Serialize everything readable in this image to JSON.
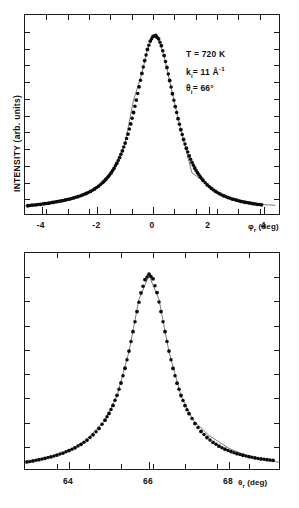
{
  "figure": {
    "ylabel": "INTENSITY (arb. units)",
    "panels": [
      {
        "id": "top",
        "xlabel_symbol": "φ",
        "xlabel_sub": "r",
        "xlabel_unit": "(deg)",
        "tick_labels": [
          "-4",
          "-2",
          "0",
          "2",
          "4"
        ],
        "annotations": {
          "temperature": "T = 720 K",
          "wavevector_symbol": "k",
          "wavevector_sub": "i",
          "wavevector_value": "= 11 Å",
          "wavevector_sup": "-1",
          "angle_symbol": "θ",
          "angle_sub": "i",
          "angle_value": "= 66°"
        }
      },
      {
        "id": "bottom",
        "xlabel_symbol": "θ",
        "xlabel_sub": "r",
        "xlabel_unit": "(deg)",
        "tick_labels": [
          "64",
          "66",
          "68"
        ]
      }
    ]
  },
  "chart_data": [
    {
      "type": "scatter",
      "id": "top-panel",
      "title": "",
      "xlabel": "φr (deg)",
      "ylabel": "INTENSITY (arb. units)",
      "xlim": [
        -4.6,
        4.6
      ],
      "ylim": [
        0,
        1.08
      ],
      "xticks": [
        -4,
        -2,
        0,
        2,
        4
      ],
      "xtick_labels": [
        "-4",
        "-2",
        "0",
        "2",
        "4"
      ],
      "yticks": [],
      "grid": false,
      "legend": null,
      "annotations": [
        "T = 720 K",
        "ki = 11 Å-1",
        "θi = 66°"
      ],
      "series": [
        {
          "name": "measured intensity",
          "marker": "filled-circle",
          "x": [
            -4.5,
            -4.35,
            -4.2,
            -4.05,
            -3.9,
            -3.75,
            -3.6,
            -3.45,
            -3.3,
            -3.15,
            -3.0,
            -2.85,
            -2.7,
            -2.55,
            -2.4,
            -2.25,
            -2.1,
            -1.95,
            -1.8,
            -1.7,
            -1.6,
            -1.5,
            -1.4,
            -1.3,
            -1.2,
            -1.1,
            -1.0,
            -0.9,
            -0.8,
            -0.7,
            -0.6,
            -0.5,
            -0.4,
            -0.3,
            -0.2,
            -0.1,
            0.0,
            0.1,
            0.2,
            0.3,
            0.4,
            0.5,
            0.6,
            0.7,
            0.8,
            0.9,
            1.0,
            1.1,
            1.2,
            1.3,
            1.4,
            1.5,
            1.6,
            1.7,
            1.8,
            1.95,
            2.1,
            2.25,
            2.4,
            2.55,
            2.7,
            2.85,
            3.0,
            3.15,
            3.3,
            3.45,
            3.6,
            3.75,
            3.9
          ],
          "y": [
            0.055,
            0.058,
            0.06,
            0.063,
            0.066,
            0.069,
            0.073,
            0.077,
            0.081,
            0.086,
            0.091,
            0.097,
            0.104,
            0.112,
            0.121,
            0.132,
            0.145,
            0.161,
            0.181,
            0.196,
            0.213,
            0.233,
            0.256,
            0.283,
            0.314,
            0.35,
            0.392,
            0.44,
            0.495,
            0.556,
            0.623,
            0.694,
            0.766,
            0.835,
            0.895,
            0.94,
            0.965,
            0.97,
            0.952,
            0.915,
            0.862,
            0.798,
            0.728,
            0.657,
            0.588,
            0.523,
            0.464,
            0.411,
            0.364,
            0.323,
            0.288,
            0.258,
            0.232,
            0.21,
            0.191,
            0.167,
            0.148,
            0.132,
            0.119,
            0.108,
            0.099,
            0.091,
            0.085,
            0.079,
            0.074,
            0.07,
            0.066,
            0.063,
            0.06
          ]
        },
        {
          "name": "fit curve",
          "marker": "line",
          "x": [
            -4.6,
            -4.0,
            -3.4,
            -2.8,
            -2.2,
            -1.8,
            -1.4,
            -1.0,
            -0.7,
            -0.4,
            -0.2,
            0.0,
            0.2,
            0.4,
            0.7,
            1.0,
            1.4,
            1.8,
            2.2,
            2.8,
            3.4,
            4.0,
            4.4
          ],
          "y": [
            0.054,
            0.062,
            0.077,
            0.099,
            0.138,
            0.182,
            0.255,
            0.392,
            0.622,
            0.765,
            0.896,
            0.962,
            0.95,
            0.86,
            0.655,
            0.463,
            0.231,
            0.19,
            0.135,
            0.093,
            0.073,
            0.061,
            0.057
          ]
        }
      ]
    },
    {
      "type": "scatter",
      "id": "bottom-panel",
      "title": "",
      "xlabel": "θr (deg)",
      "ylabel": "INTENSITY (arb. units)",
      "xlim": [
        62.9,
        69.3
      ],
      "ylim": [
        0,
        1.08
      ],
      "xticks": [
        64,
        66,
        68
      ],
      "xtick_labels": [
        "64",
        "66",
        "68"
      ],
      "yticks": [],
      "grid": false,
      "legend": null,
      "series": [
        {
          "name": "measured intensity",
          "marker": "filled-circle",
          "x": [
            62.95,
            63.1,
            63.25,
            63.4,
            63.55,
            63.7,
            63.85,
            64.0,
            64.15,
            64.3,
            64.45,
            64.6,
            64.75,
            64.9,
            65.0,
            65.1,
            65.2,
            65.3,
            65.4,
            65.5,
            65.6,
            65.7,
            65.8,
            65.9,
            66.0,
            66.1,
            66.2,
            66.3,
            66.4,
            66.5,
            66.6,
            66.7,
            66.8,
            66.9,
            67.0,
            67.15,
            67.3,
            67.45,
            67.6,
            67.75,
            67.9,
            68.05,
            68.2,
            68.35,
            68.5,
            68.65,
            68.8,
            68.95,
            69.1
          ],
          "y": [
            0.045,
            0.05,
            0.056,
            0.063,
            0.07,
            0.079,
            0.089,
            0.101,
            0.115,
            0.132,
            0.153,
            0.179,
            0.211,
            0.252,
            0.285,
            0.325,
            0.375,
            0.436,
            0.509,
            0.594,
            0.69,
            0.79,
            0.882,
            0.948,
            0.975,
            0.952,
            0.884,
            0.79,
            0.69,
            0.594,
            0.508,
            0.435,
            0.374,
            0.324,
            0.284,
            0.235,
            0.196,
            0.166,
            0.142,
            0.123,
            0.108,
            0.096,
            0.086,
            0.078,
            0.071,
            0.065,
            0.06,
            0.056,
            0.053
          ]
        },
        {
          "name": "fit curve",
          "marker": "line",
          "x": [
            62.9,
            63.4,
            63.9,
            64.4,
            64.9,
            65.2,
            65.5,
            65.75,
            66.0,
            66.25,
            66.5,
            66.8,
            67.1,
            67.5,
            68.0,
            68.5,
            69.0,
            69.25
          ],
          "y": [
            0.044,
            0.062,
            0.092,
            0.148,
            0.25,
            0.372,
            0.592,
            0.852,
            0.968,
            0.85,
            0.59,
            0.372,
            0.252,
            0.176,
            0.112,
            0.071,
            0.05,
            0.044
          ]
        }
      ]
    }
  ]
}
